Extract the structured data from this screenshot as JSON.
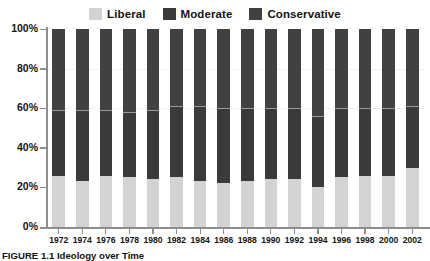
{
  "legend": {
    "position": "top-center",
    "items": [
      {
        "label": "Liberal",
        "color": "#d3d3d3",
        "icon": "legend-swatch-icon"
      },
      {
        "label": "Moderate",
        "color": "#3a3a3a",
        "icon": "legend-swatch-icon"
      },
      {
        "label": "Conservative",
        "color": "#414141",
        "icon": "legend-swatch-icon"
      }
    ]
  },
  "caption": {
    "figure_number": "FIGURE 1.1",
    "title": "Ideology over Time",
    "full": "FIGURE 1.1 Ideology over Time"
  },
  "chart_data": {
    "type": "bar",
    "stacked": true,
    "stack_total": 100,
    "title": "Ideology over Time",
    "xlabel": "",
    "ylabel": "",
    "ylim": [
      0,
      100
    ],
    "yticks": [
      0,
      20,
      40,
      60,
      80,
      100
    ],
    "ytick_labels": [
      "0%",
      "20%",
      "40%",
      "60%",
      "80%",
      "100%"
    ],
    "grid": false,
    "legend_position": "top-center",
    "categories": [
      "1972",
      "1974",
      "1976",
      "1978",
      "1980",
      "1982",
      "1984",
      "1986",
      "1988",
      "1990",
      "1992",
      "1994",
      "1996",
      "1998",
      "2000",
      "2002"
    ],
    "series": [
      {
        "name": "Liberal",
        "color": "#d3d3d3",
        "values": [
          26,
          23,
          26,
          25,
          24,
          25,
          23,
          22,
          23,
          24,
          24,
          20,
          25,
          26,
          26,
          30
        ]
      },
      {
        "name": "Moderate",
        "color": "#3a3a3a",
        "values": [
          33,
          36,
          33,
          33,
          35,
          36,
          38,
          38,
          37,
          36,
          36,
          36,
          35,
          34,
          34,
          31
        ]
      },
      {
        "name": "Conservative",
        "color": "#414141",
        "values": [
          41,
          41,
          41,
          42,
          41,
          39,
          39,
          40,
          40,
          40,
          40,
          44,
          40,
          40,
          40,
          39
        ]
      }
    ]
  }
}
